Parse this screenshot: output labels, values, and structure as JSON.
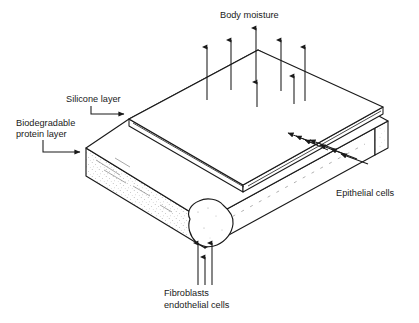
{
  "figure": {
    "title": "",
    "background_color": "#ffffff",
    "line_color": "#1a1a1a",
    "text_color": "#1a1a1a"
  },
  "labels": {
    "body_moisture": "Body moisture",
    "silicone_layer": "Silicone layer",
    "biodegradable_line1": "Biodegradable",
    "biodegradable_line2": "protein layer",
    "epithelial_cells": "Epithelial cells",
    "fibroblasts_line1": "Fibroblasts",
    "fibroblasts_line2": "endothelial cells"
  },
  "diagram_data": {
    "type": "schematic-cross-section",
    "subject": "Artificial skin bilayer graft",
    "layers": [
      {
        "name": "Silicone layer",
        "position": "top",
        "thickness": "thin"
      },
      {
        "name": "Biodegradable protein layer",
        "position": "bottom",
        "thickness": "thick"
      }
    ],
    "flows": [
      {
        "label": "Body moisture",
        "direction": "upward",
        "count": 7,
        "origin": "through silicone layer"
      },
      {
        "label": "Epithelial cells",
        "direction": "inward-left",
        "count": 7,
        "origin": "right side face"
      },
      {
        "label": "Fibroblasts endothelial cells",
        "direction": "upward",
        "count": 3,
        "origin": "bottom front corner"
      }
    ]
  }
}
